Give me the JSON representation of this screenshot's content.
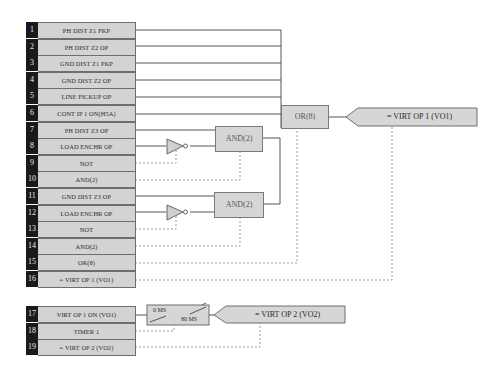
{
  "diagram": {
    "type": "FlexLogic equation editor diagram",
    "block1": {
      "rows": [
        {
          "num": "1",
          "label": "PH DIST Z1 PKP"
        },
        {
          "num": "2",
          "label": "PH DIST Z2 OP"
        },
        {
          "num": "3",
          "label": "GND DIST Z1 PKP"
        },
        {
          "num": "4",
          "label": "GND DIST Z2 OP"
        },
        {
          "num": "5",
          "label": "LINE PICKUP OP"
        },
        {
          "num": "6",
          "label": "CONT IP 1 ON(H5A)"
        },
        {
          "num": "7",
          "label": "PH DIST Z3 OP"
        },
        {
          "num": "8",
          "label": "LOAD ENCHR OP"
        },
        {
          "num": "9",
          "label": "NOT"
        },
        {
          "num": "10",
          "label": "AND(2)"
        },
        {
          "num": "11",
          "label": "GND DIST Z3 OP"
        },
        {
          "num": "12",
          "label": "LOAD ENCHR OP"
        },
        {
          "num": "13",
          "label": "NOT"
        },
        {
          "num": "14",
          "label": "AND(2)"
        },
        {
          "num": "15",
          "label": "OR(8)"
        },
        {
          "num": "16",
          "label": "= VIRT OP 1 (VO1)"
        }
      ],
      "gates": {
        "and_top": "AND(2)",
        "and_bottom": "AND(2)",
        "or": "OR(8)",
        "output": "= VIRT OP 1 (VO1)"
      }
    },
    "block2": {
      "rows": [
        {
          "num": "17",
          "label": "VIRT OP 1 ON (VO1)"
        },
        {
          "num": "18",
          "label": "TIMER 1"
        },
        {
          "num": "19",
          "label": "= VIRT OP 2 (VO2)"
        }
      ],
      "timer": {
        "pickup": "0 MS",
        "dropout": "80 MS"
      },
      "output": "= VIRT OP 2 (VO2)"
    },
    "colors": {
      "number_column": "#1a1a1a",
      "cell_fill": "#d3d3d3",
      "gate_fill": "#d6d6d6",
      "wire": "#555555",
      "dotted_wire": "#9a9a9a"
    }
  }
}
